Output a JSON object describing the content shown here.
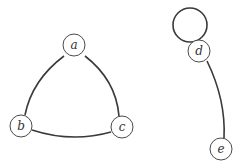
{
  "graph": {
    "nodes": [
      {
        "id": "a",
        "label": "a",
        "x": 74,
        "y": 45
      },
      {
        "id": "b",
        "label": "b",
        "x": 21,
        "y": 126
      },
      {
        "id": "c",
        "label": "c",
        "x": 122,
        "y": 127
      },
      {
        "id": "d",
        "label": "d",
        "x": 199,
        "y": 51
      },
      {
        "id": "e",
        "label": "e",
        "x": 221,
        "y": 149
      }
    ],
    "edges": [
      {
        "from": "a",
        "to": "b"
      },
      {
        "from": "a",
        "to": "c"
      },
      {
        "from": "b",
        "to": "c"
      },
      {
        "from": "d",
        "to": "d",
        "type": "loop"
      },
      {
        "from": "d",
        "to": "e"
      }
    ]
  }
}
